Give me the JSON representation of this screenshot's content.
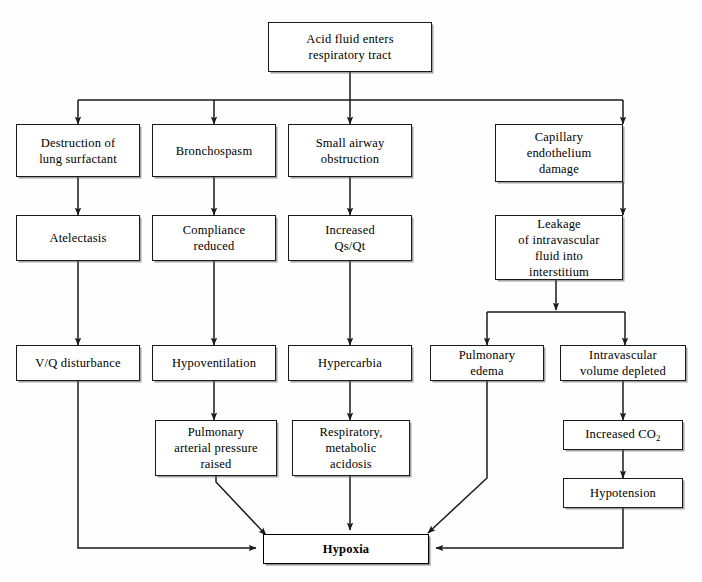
{
  "diagram": {
    "nodes": [
      {
        "id": "acid",
        "label": "Acid fluid enters\nrespiratory tract"
      },
      {
        "id": "surfactant",
        "label": "Destruction of\nlung surfactant"
      },
      {
        "id": "broncho",
        "label": "Bronchospasm"
      },
      {
        "id": "smallairway",
        "label": "Small airway\nobstruction"
      },
      {
        "id": "capillary",
        "label": "Capillary\nendothelium\ndamage"
      },
      {
        "id": "atelectasis",
        "label": "Atelectasis"
      },
      {
        "id": "compliance",
        "label": "Compliance\nreduced"
      },
      {
        "id": "qsqt",
        "label": "Increased\nQs/Qt"
      },
      {
        "id": "leakage",
        "label": "Leakage\nof intravascular\nfluid into\ninterstitium"
      },
      {
        "id": "vq",
        "label": "V/Q disturbance"
      },
      {
        "id": "hypovent",
        "label": "Hypoventilation"
      },
      {
        "id": "hypercarbia",
        "label": "Hypercarbia"
      },
      {
        "id": "pulmedema",
        "label": "Pulmonary\nedema"
      },
      {
        "id": "intravasc",
        "label": "Intravascular\nvolume depleted"
      },
      {
        "id": "papraised",
        "label": "Pulmonary\narterial pressure\nraised"
      },
      {
        "id": "acidosis",
        "label": "Respiratory,\nmetabolic\nacidosis"
      },
      {
        "id": "co2",
        "label_html": "Increased CO<sub>2</sub>",
        "label": "Increased CO2"
      },
      {
        "id": "hypotension",
        "label": "Hypotension"
      },
      {
        "id": "hypoxia",
        "label": "Hypoxia"
      }
    ],
    "edges": [
      {
        "from": "acid",
        "to": "surfactant"
      },
      {
        "from": "acid",
        "to": "broncho"
      },
      {
        "from": "acid",
        "to": "smallairway"
      },
      {
        "from": "acid",
        "to": "capillary"
      },
      {
        "from": "surfactant",
        "to": "atelectasis"
      },
      {
        "from": "broncho",
        "to": "compliance"
      },
      {
        "from": "smallairway",
        "to": "qsqt"
      },
      {
        "from": "capillary",
        "to": "leakage"
      },
      {
        "from": "atelectasis",
        "to": "vq"
      },
      {
        "from": "compliance",
        "to": "hypovent"
      },
      {
        "from": "qsqt",
        "to": "hypercarbia"
      },
      {
        "from": "leakage",
        "to": "pulmedema"
      },
      {
        "from": "leakage",
        "to": "intravasc"
      },
      {
        "from": "hypovent",
        "to": "papraised"
      },
      {
        "from": "hypercarbia",
        "to": "acidosis"
      },
      {
        "from": "intravasc",
        "to": "co2"
      },
      {
        "from": "co2",
        "to": "hypotension"
      },
      {
        "from": "vq",
        "to": "hypoxia"
      },
      {
        "from": "papraised",
        "to": "hypoxia"
      },
      {
        "from": "acidosis",
        "to": "hypoxia"
      },
      {
        "from": "pulmedema",
        "to": "hypoxia"
      },
      {
        "from": "hypotension",
        "to": "hypoxia"
      }
    ],
    "colors": {
      "line": "#1a1a1a",
      "box_border": "#1a1a1a",
      "box_fill": "#ffffff",
      "background": "#fefefe"
    }
  }
}
